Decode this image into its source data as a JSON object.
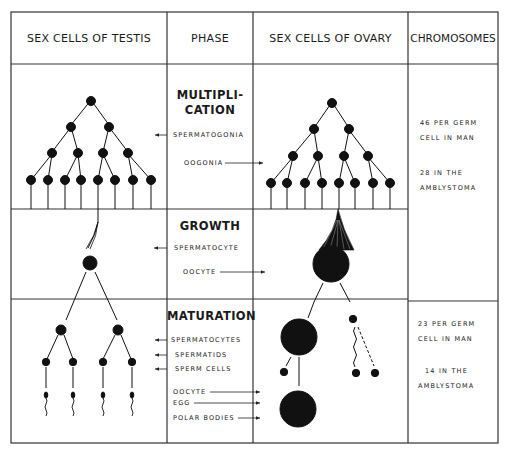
{
  "headers": {
    "testis": "SEX CELLS OF TESTIS",
    "phase": "PHASE",
    "ovary": "SEX CELLS OF OVARY",
    "chromosomes": "CHROMOSOMES"
  },
  "phases": {
    "multiplication": {
      "title_line1": "MULTIPLI-",
      "title_line2": "CATION",
      "labels": [
        "SPERMATOGONIA",
        "OOGONIA"
      ]
    },
    "growth": {
      "title": "GROWTH",
      "labels": [
        "SPERMATOCYTE",
        "OOCYTE"
      ]
    },
    "maturation": {
      "title": "MATURATION",
      "labels": [
        "SPERMATOCYTES",
        "SPERMATIDS",
        "SPERM CELLS",
        "OOCYTE",
        "EGG",
        "POLAR BODIES"
      ]
    }
  },
  "chromosomes": {
    "diploid": {
      "line1": "46 PER GERM",
      "line2": "CELL IN MAN",
      "line3": "28 IN THE",
      "line4": "AMBLYSTOMA"
    },
    "haploid": {
      "line1": "23 PER GERM",
      "line2": "CELL IN MAN",
      "line3": "14 IN THE",
      "line4": "AMBLYSTOMA"
    }
  },
  "colors": {
    "ink": "#111111",
    "background": "#ffffff",
    "grid": "#333333"
  }
}
